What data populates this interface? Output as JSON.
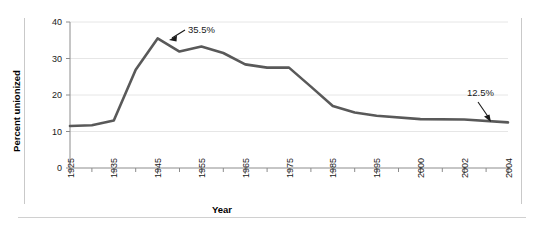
{
  "chart_data": {
    "type": "line",
    "title": "",
    "xlabel": "Year",
    "ylabel": "Percent unionized",
    "ylim": [
      0,
      40
    ],
    "yticks": [
      0,
      10,
      20,
      30,
      40
    ],
    "ytick_labels": [
      "0",
      "10",
      "20",
      "30",
      "40"
    ],
    "grid": true,
    "grid_axis": "y",
    "legend": "none",
    "line_color": "#595959",
    "categories": [
      "1925",
      "1930",
      "1935",
      "1940",
      "1945",
      "1950",
      "1955",
      "1960",
      "1965",
      "1970",
      "1975",
      "1980",
      "1985",
      "1990",
      "1995",
      "2000",
      "2002",
      "2004"
    ],
    "xtick_labels": [
      "1925",
      "1935",
      "1945",
      "1955",
      "1965",
      "1975",
      "1985",
      "1995",
      "2000",
      "2002",
      "2004"
    ],
    "x": [
      1925,
      1930,
      1935,
      1940,
      1945,
      1950,
      1955,
      1960,
      1965,
      1970,
      1975,
      1980,
      1985,
      1990,
      1995,
      2000,
      2002,
      2004
    ],
    "values": [
      11.5,
      11.7,
      13.0,
      26.9,
      35.5,
      31.9,
      33.3,
      31.5,
      28.4,
      27.5,
      27.5,
      22.3,
      17.0,
      15.2,
      14.3,
      13.4,
      13.3,
      12.5
    ],
    "series": [
      {
        "name": "Percent unionized",
        "values": [
          11.5,
          11.7,
          13.0,
          26.9,
          35.5,
          31.9,
          33.3,
          31.5,
          28.4,
          27.5,
          27.5,
          22.3,
          17.0,
          15.2,
          14.3,
          13.4,
          13.3,
          12.5
        ]
      }
    ],
    "annotations": [
      {
        "label": "35.5%",
        "x": 1945,
        "y": 35.5
      },
      {
        "label": "12.5%",
        "x": 2004,
        "y": 12.5
      }
    ]
  }
}
